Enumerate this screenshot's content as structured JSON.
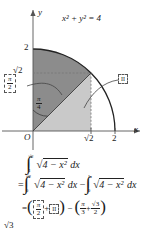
{
  "figure": {
    "curve_equation": "x² + y² = 4",
    "axis_x_label": "x",
    "axis_y_label": "y",
    "origin_label": "O",
    "x_ticks": [
      "√2",
      "2"
    ],
    "y_ticks": [
      "2",
      "√2"
    ],
    "angle_label_num": "π",
    "angle_label_den": "4",
    "callout_sector_num": "π",
    "callout_sector_den": "2",
    "callout_region_label": "II",
    "colors": {
      "dark_region": "#8c8c8c",
      "light_region": "#c9c9c9",
      "curve": "#222222",
      "axis": "#555555",
      "dashed": "#777777"
    }
  },
  "math": {
    "line1": {
      "int_symbol": "∫",
      "upper": "√2",
      "lower": "1",
      "radical": "√",
      "integrand": "4 − x²",
      "differential": "dx"
    },
    "line2": {
      "equals": "=",
      "int_symbol": "∫",
      "term1_upper": "√2",
      "term1_lower": "0",
      "radical": "√",
      "integrand": "4 − x²",
      "differential": "dx",
      "minus": "−",
      "term2_upper": "1",
      "term2_lower": "0"
    },
    "line3": {
      "equals": "=",
      "open_paren": "(",
      "boxed_frac_num": "π",
      "boxed_frac_den": "2",
      "plus": "+",
      "boxed_roman": "II",
      "close_paren": ")",
      "minus": "−",
      "open_paren2": "(",
      "frac2_num": "π",
      "frac2_den": "3",
      "plus2": "+",
      "frac3_num": "√3",
      "frac3_den": "2",
      "close_paren2": ")"
    },
    "line4_partial": "√3"
  }
}
